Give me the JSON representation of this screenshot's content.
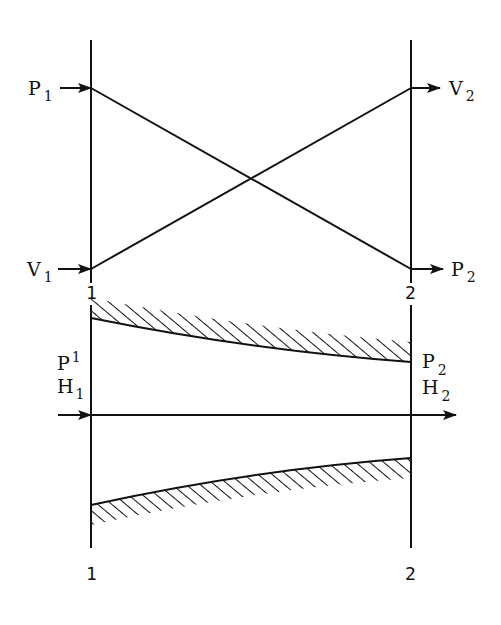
{
  "diagram": {
    "top_panel": {
      "description": "Crossing lines showing pressure and velocity variation between section 1 and section 2",
      "left_labels": {
        "upper": {
          "main": "P",
          "sub": "1"
        },
        "lower": {
          "main": "V",
          "sub": "1"
        }
      },
      "right_labels": {
        "upper": {
          "main": "V",
          "sub": "2"
        },
        "lower": {
          "main": "P",
          "sub": "2"
        }
      },
      "section_labels": {
        "left": "1",
        "right": "2"
      }
    },
    "bottom_panel": {
      "description": "Converging duct / nozzle with hatched walls and flow axis arrow",
      "left_labels": {
        "p": {
          "main": "P",
          "sub": "1"
        },
        "h": {
          "main": "H",
          "sub": "1"
        }
      },
      "right_labels": {
        "p": {
          "main": "P",
          "sub": "2"
        },
        "h": {
          "main": "H",
          "sub": "2"
        }
      },
      "section_labels": {
        "left": "1",
        "right": "2"
      }
    },
    "colors": {
      "ink": "#111111",
      "background": "#ffffff"
    }
  }
}
